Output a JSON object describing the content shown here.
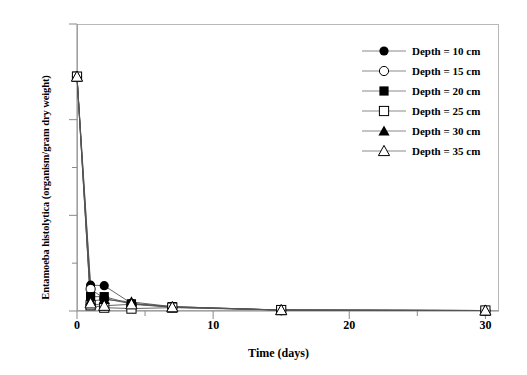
{
  "chart_data": {
    "type": "line",
    "title": "",
    "xlabel": "Time (days)",
    "ylabel": "Entamoeba histolytica (organism/gram dry weight)",
    "xlim": [
      0,
      31
    ],
    "ylim": [
      0,
      60
    ],
    "xticks": [
      0,
      10,
      20,
      30
    ],
    "xticklabels": [
      "0",
      "10",
      "20",
      "30"
    ],
    "xminorticks": [
      5,
      15,
      25
    ],
    "yticks": [
      0,
      20,
      40,
      60
    ],
    "yticklabels": [
      "0",
      "20",
      "40",
      "60"
    ],
    "yminorticks": [
      10,
      30,
      50
    ],
    "grid": false,
    "legend_position": "upper right",
    "x": [
      0,
      1,
      2,
      4,
      7,
      15,
      30
    ],
    "series": [
      {
        "name": "Depth = 10 cm",
        "marker": "circle-filled",
        "values": [
          49,
          5.4,
          5.3,
          1.6,
          0.9,
          0.2,
          0.1
        ]
      },
      {
        "name": "Depth = 15 cm",
        "marker": "circle-open",
        "values": [
          49,
          4.6,
          2.6,
          1.5,
          0.8,
          0.2,
          0.1
        ]
      },
      {
        "name": "Depth = 20 cm",
        "marker": "square-filled",
        "values": [
          49,
          3.0,
          3.0,
          1.5,
          0.9,
          0.2,
          0.1
        ]
      },
      {
        "name": "Depth = 25 cm",
        "marker": "square-open",
        "values": [
          49,
          1.2,
          0.7,
          0.5,
          0.7,
          0.2,
          0.1
        ]
      },
      {
        "name": "Depth = 30 cm",
        "marker": "triangle-filled",
        "values": [
          49,
          2.1,
          2.4,
          1.9,
          0.9,
          0.2,
          0.1
        ]
      },
      {
        "name": "Depth = 35 cm",
        "marker": "triangle-open",
        "values": [
          49,
          1.6,
          1.1,
          1.4,
          0.8,
          0.2,
          0.1
        ]
      }
    ]
  },
  "legend": {
    "entries": [
      {
        "label": "Depth = 10 cm",
        "marker": "circle-filled"
      },
      {
        "label": "Depth = 15 cm",
        "marker": "circle-open"
      },
      {
        "label": "Depth = 20 cm",
        "marker": "square-filled"
      },
      {
        "label": "Depth = 25 cm",
        "marker": "square-open"
      },
      {
        "label": "Depth = 30 cm",
        "marker": "triangle-filled"
      },
      {
        "label": "Depth = 35 cm",
        "marker": "triangle-open"
      }
    ]
  },
  "colors": {
    "line": "#555555",
    "marker": "#000000",
    "axis": "#8a8a8a",
    "frame": "#b8b8b8",
    "background": "#ffffff"
  }
}
